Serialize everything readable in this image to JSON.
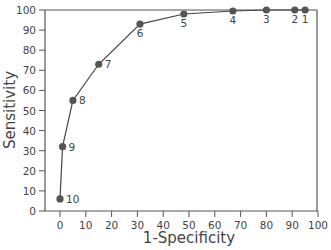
{
  "chart_data": {
    "type": "line",
    "title": "",
    "xlabel": "1-Specificity",
    "ylabel": "Sensitivity",
    "xlim": [
      0,
      100
    ],
    "ylim": [
      0,
      100
    ],
    "x_ticks": [
      0,
      10,
      20,
      30,
      40,
      50,
      60,
      70,
      80,
      90,
      100
    ],
    "y_ticks": [
      0,
      10,
      20,
      30,
      40,
      50,
      60,
      70,
      80,
      90,
      100
    ],
    "grid": false,
    "legend": null,
    "series": [
      {
        "name": "ROC curve",
        "points": [
          {
            "label": "10",
            "x": 0,
            "y": 6
          },
          {
            "label": "9",
            "x": 1,
            "y": 32
          },
          {
            "label": "8",
            "x": 5,
            "y": 55
          },
          {
            "label": "7",
            "x": 15,
            "y": 73
          },
          {
            "label": "6",
            "x": 31,
            "y": 93
          },
          {
            "label": "5",
            "x": 48,
            "y": 98
          },
          {
            "label": "4",
            "x": 67,
            "y": 99.5
          },
          {
            "label": "3",
            "x": 80,
            "y": 100
          },
          {
            "label": "2",
            "x": 91,
            "y": 100
          },
          {
            "label": "1",
            "x": 95,
            "y": 100
          }
        ]
      }
    ]
  },
  "colors": {
    "axis": "#555555",
    "line": "#444444",
    "marker": "#555555",
    "text": "#444444"
  }
}
